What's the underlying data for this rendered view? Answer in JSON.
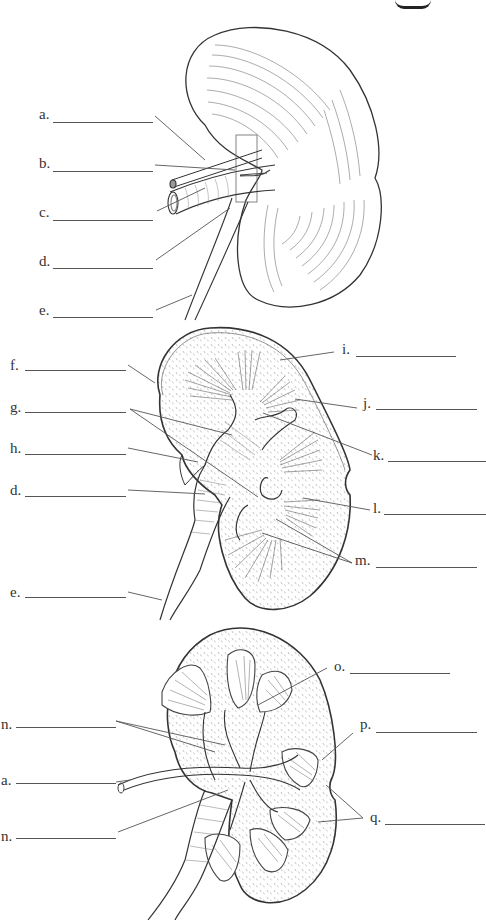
{
  "diagram": {
    "type": "anatomical-labeling-worksheet",
    "views": [
      {
        "id": "external",
        "description": "external view of kidney with hilum vessels and ureter"
      },
      {
        "id": "frontal-section",
        "description": "frontal section showing internal structures"
      },
      {
        "id": "vascular-section",
        "description": "frontal section showing blood vessels"
      }
    ]
  },
  "labels": {
    "top": [
      {
        "letter": "a.",
        "x": 39,
        "y": 113,
        "blank_x": 53,
        "blank_w": 100
      },
      {
        "letter": "b.",
        "x": 39,
        "y": 162,
        "blank_x": 53,
        "blank_w": 100
      },
      {
        "letter": "c.",
        "x": 39,
        "y": 211,
        "blank_x": 53,
        "blank_w": 100
      },
      {
        "letter": "d.",
        "x": 39,
        "y": 260,
        "blank_x": 53,
        "blank_w": 100
      },
      {
        "letter": "e.",
        "x": 39,
        "y": 309,
        "blank_x": 53,
        "blank_w": 100
      }
    ],
    "middle_left": [
      {
        "letter": "f.",
        "x": 10,
        "y": 363,
        "blank_x": 25,
        "blank_w": 101
      },
      {
        "letter": "g.",
        "x": 10,
        "y": 405,
        "blank_x": 25,
        "blank_w": 101
      },
      {
        "letter": "h.",
        "x": 10,
        "y": 447,
        "blank_x": 25,
        "blank_w": 101
      },
      {
        "letter": "d.",
        "x": 10,
        "y": 490,
        "blank_x": 25,
        "blank_w": 101
      },
      {
        "letter": "e.",
        "x": 10,
        "y": 591,
        "blank_x": 25,
        "blank_w": 101
      }
    ],
    "middle_right": [
      {
        "letter": "i.",
        "x": 342,
        "y": 348,
        "blank_x": 356,
        "blank_w": 100
      },
      {
        "letter": "j.",
        "x": 363,
        "y": 401,
        "blank_x": 376,
        "blank_w": 101
      },
      {
        "letter": "k.",
        "x": 373,
        "y": 453,
        "blank_x": 388,
        "blank_w": 98
      },
      {
        "letter": "l.",
        "x": 373,
        "y": 506,
        "blank_x": 384,
        "blank_w": 102
      },
      {
        "letter": "m.",
        "x": 355,
        "y": 559,
        "blank_x": 376,
        "blank_w": 101
      }
    ],
    "bottom_left": [
      {
        "letter": "n.",
        "x": 1,
        "y": 723,
        "blank_x": 16,
        "blank_w": 100
      },
      {
        "letter": "a.",
        "x": 1,
        "y": 779,
        "blank_x": 16,
        "blank_w": 100
      },
      {
        "letter": "n.",
        "x": 1,
        "y": 835,
        "blank_x": 16,
        "blank_w": 100
      }
    ],
    "bottom_right": [
      {
        "letter": "o.",
        "x": 334,
        "y": 665,
        "blank_x": 350,
        "blank_w": 100
      },
      {
        "letter": "p.",
        "x": 360,
        "y": 723,
        "blank_x": 376,
        "blank_w": 101
      },
      {
        "letter": "q.",
        "x": 370,
        "y": 816,
        "blank_x": 385,
        "blank_w": 100
      }
    ]
  },
  "colors": {
    "ink": "#2a2a2a",
    "leader": "#555555",
    "background": "#ffffff"
  }
}
